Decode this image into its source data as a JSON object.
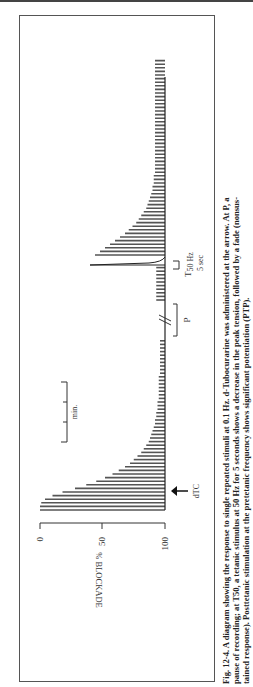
{
  "figure": {
    "caption_lines": [
      "Fig. 12-4. A diagram showing the response to single repeated stimuli at 0.1 Hz. d-Tubocurarine was administered at the arrow. At P, a",
      "pause of recording; at T50, a tetanic stimulus at 50 Hz for 5 seconds shows a decrease in the peak tension, followed by a fade (nonsus-",
      "tained response). Posttetanic stimulation at the pretetanic frequency shows significant potentiation (PTP)."
    ],
    "labels": {
      "ylabel": "% BLOCKADE",
      "tick_0": "0",
      "tick_50": "50",
      "tick_100": "100",
      "arrow_label": "dTC",
      "pause_label": "P",
      "tetanus_label": "T",
      "tetanus_sub": "50 Hz",
      "tetanus_duration": "5 sec",
      "time_scale_label": "min."
    }
  },
  "chart_data": {
    "type": "bar",
    "title": "",
    "xlabel": "time",
    "ylabel": "% BLOCKADE",
    "ylim": [
      0,
      100
    ],
    "y_axis_inverted": true,
    "yticks": [
      0,
      50,
      100
    ],
    "annotations": [
      "dTC (arrow, drug administered)",
      "P (pause of recording)",
      "T50 Hz, 5 sec (tetanic stimulus)",
      "min. (time scale bar)"
    ],
    "segments": [
      {
        "name": "post-dTC decay",
        "description": "twitch height decays from 0% blockade toward ~95% blockade",
        "twitch_height_pct": [
          100,
          100,
          99,
          96,
          90,
          82,
          72,
          63,
          55,
          48,
          42,
          37,
          32,
          28,
          25,
          22,
          19,
          17,
          15,
          13,
          12,
          11,
          10,
          9,
          8,
          8,
          7,
          7,
          6,
          6,
          6,
          5,
          5,
          5,
          5,
          5,
          5,
          5,
          4,
          4,
          4,
          4,
          4,
          4,
          4,
          4,
          4,
          4
        ]
      },
      {
        "name": "after pause",
        "twitch_height_pct": [
          7,
          7,
          7,
          7,
          7,
          7,
          7,
          7,
          7,
          7
        ]
      },
      {
        "name": "tetanus 50 Hz",
        "peak_pct": 60,
        "fade_to_pct": 10
      },
      {
        "name": "PTP",
        "description": "posttetanic potentiation then decay",
        "twitch_height_pct": [
          56,
          52,
          48,
          44,
          40,
          36,
          32,
          29,
          26,
          23,
          21,
          19,
          17,
          15,
          14,
          13,
          12,
          11,
          10,
          10,
          9,
          9,
          9,
          8,
          8,
          8,
          8,
          8,
          8,
          8,
          8,
          8,
          8,
          8,
          8,
          8,
          8,
          8,
          8,
          8,
          8,
          8,
          8,
          8,
          8,
          8,
          8,
          8,
          8,
          8,
          8,
          8,
          8,
          8,
          8
        ]
      }
    ]
  }
}
